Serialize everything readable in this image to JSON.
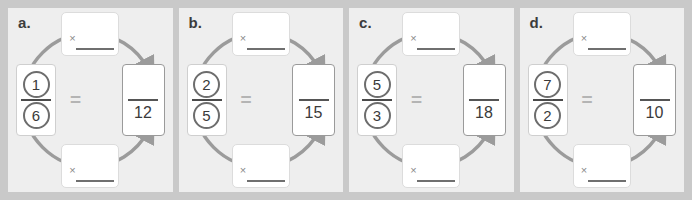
{
  "worksheet": {
    "background_color": "#c9c9c9",
    "panel_color": "#eeeeee",
    "accent_color": "#6d6d6d",
    "equals_symbol": "=",
    "multiply_symbol": "×"
  },
  "problems": [
    {
      "label": "a.",
      "numerator": "1",
      "denominator": "6",
      "result_numerator": "",
      "result_denominator": "12",
      "top_multiplier": "",
      "bottom_multiplier": ""
    },
    {
      "label": "b.",
      "numerator": "2",
      "denominator": "5",
      "result_numerator": "",
      "result_denominator": "15",
      "top_multiplier": "",
      "bottom_multiplier": ""
    },
    {
      "label": "c.",
      "numerator": "5",
      "denominator": "3",
      "result_numerator": "",
      "result_denominator": "18",
      "top_multiplier": "",
      "bottom_multiplier": ""
    },
    {
      "label": "d.",
      "numerator": "7",
      "denominator": "2",
      "result_numerator": "",
      "result_denominator": "10",
      "top_multiplier": "",
      "bottom_multiplier": ""
    }
  ]
}
